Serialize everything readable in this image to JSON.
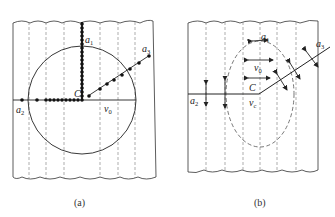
{
  "figure": {
    "panels": [
      {
        "id": "a",
        "caption": "(a)",
        "labels": {
          "a1": {
            "main": "a",
            "sub": "1"
          },
          "a2": {
            "main": "a",
            "sub": "2"
          },
          "a3": {
            "main": "a",
            "sub": "3"
          },
          "center": "C",
          "v0": {
            "main": "v",
            "sub": "0"
          }
        },
        "description": "Fibrous strip with circle; dotted radial paths a1 (up), a2 (left), a3 (diagonal up-right) from center C"
      },
      {
        "id": "b",
        "caption": "(b)",
        "labels": {
          "a1": {
            "main": "a",
            "sub": "1"
          },
          "a2": {
            "main": "a",
            "sub": "2"
          },
          "a3": {
            "main": "a",
            "sub": "3"
          },
          "center": "C",
          "v0": {
            "main": "v",
            "sub": "0"
          },
          "vc": {
            "main": "v",
            "sub": "c"
          }
        },
        "description": "Fibrous strip with dashed ellipse; double-headed arrows indicating vibration directions along paths"
      }
    ],
    "colors": {
      "line": "#222222",
      "dashed": "#777777",
      "background": "#ffffff"
    }
  }
}
